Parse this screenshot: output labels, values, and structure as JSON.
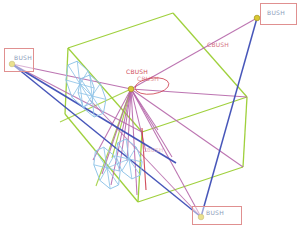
{
  "colors": {
    "background": "#ffffff",
    "frame_green": "#9acd32",
    "spring_magenta": "#b565a8",
    "link_blue": "#3d4db5",
    "wheel_blue": "#92c5e8",
    "marker_red": "#cc3a4a",
    "label_box_red": "#e09090",
    "bush_text": "#8c9cba",
    "node_yellow": "#d9c832",
    "node_outline": "#a39420"
  },
  "labels": {
    "bush_boxes": [
      {
        "text": "BUSH",
        "rect": [
          4,
          48,
          30,
          24
        ],
        "text_pos": [
          14,
          54
        ]
      },
      {
        "text": "BUSH",
        "rect": [
          260,
          3,
          37,
          22
        ],
        "text_pos": [
          267,
          9
        ]
      },
      {
        "text": "BUSH",
        "rect": [
          192,
          206,
          50,
          19
        ],
        "text_pos": [
          206,
          209
        ]
      }
    ],
    "free_labels": [
      {
        "text": "CBUSH",
        "pos": [
          207,
          42
        ],
        "color": "#d4717f",
        "opacity": 1,
        "size": 6
      },
      {
        "text": "CBUSH",
        "pos": [
          143,
          147
        ],
        "color": "#e2a3b8",
        "opacity": 0.85,
        "size": 5.5
      },
      {
        "text": "CBUSH",
        "pos": [
          126,
          69
        ],
        "color": "#cc3a4a",
        "opacity": 0.9,
        "size": 6
      },
      {
        "text": "CBUSH",
        "pos": [
          137,
          76
        ],
        "color": "#cc3a4a",
        "opacity": 0.6,
        "size": 6
      }
    ]
  },
  "geometry": {
    "hub": [
      131,
      89
    ],
    "frame_edges": [
      [
        [
          173,
          13
        ],
        [
          68,
          48
        ]
      ],
      [
        [
          173,
          13
        ],
        [
          247,
          97
        ]
      ],
      [
        [
          68,
          48
        ],
        [
          142,
          132
        ]
      ],
      [
        [
          142,
          132
        ],
        [
          247,
          97
        ]
      ],
      [
        [
          68,
          48
        ],
        [
          65,
          114
        ]
      ],
      [
        [
          142,
          132
        ],
        [
          138,
          202
        ]
      ],
      [
        [
          247,
          97
        ],
        [
          243,
          167
        ]
      ],
      [
        [
          65,
          114
        ],
        [
          138,
          202
        ]
      ],
      [
        [
          138,
          202
        ],
        [
          243,
          167
        ]
      ]
    ],
    "frame_links": [
      [
        [
          131,
          89
        ],
        [
          60,
          122
        ]
      ],
      [
        [
          131,
          89
        ],
        [
          96,
          186
        ]
      ],
      [
        [
          131,
          89
        ],
        [
          112,
          158
        ]
      ]
    ],
    "spring_targets": [
      [
        12,
        64
      ],
      [
        257,
        18
      ],
      [
        201,
        217
      ],
      [
        243,
        167
      ],
      [
        247,
        97
      ],
      [
        93,
        160
      ],
      [
        102,
        174
      ],
      [
        111,
        185
      ],
      [
        119,
        171
      ],
      [
        127,
        161
      ],
      [
        137,
        195
      ],
      [
        146,
        152
      ],
      [
        158,
        130
      ],
      [
        172,
        157
      ]
    ],
    "extra_springs": [
      [
        [
          90,
          100
        ],
        [
          201,
          217
        ]
      ],
      [
        [
          12,
          64
        ],
        [
          142,
          132
        ]
      ]
    ],
    "red_line": [
      [
        142,
        128
      ],
      [
        146,
        190
      ]
    ],
    "blue_lines": [
      [
        [
          12,
          64
        ],
        [
          201,
          217
        ]
      ],
      [
        [
          12,
          64
        ],
        [
          176,
          163
        ]
      ],
      [
        [
          257,
          18
        ],
        [
          201,
          217
        ]
      ]
    ],
    "wheels": [
      {
        "cx": 80,
        "cy": 84,
        "rx": 13,
        "ry": 24,
        "rot": -18
      },
      {
        "cx": 92,
        "cy": 96,
        "rx": 13,
        "ry": 22,
        "rot": -18
      },
      {
        "cx": 107,
        "cy": 168,
        "rx": 12,
        "ry": 22,
        "rot": -20
      },
      {
        "cx": 129,
        "cy": 159,
        "rx": 12,
        "ry": 21,
        "rot": -20
      }
    ],
    "axles": [
      [
        [
          80,
          84
        ],
        [
          92,
          96
        ]
      ],
      [
        [
          107,
          168
        ],
        [
          129,
          159
        ]
      ]
    ],
    "highlight_ellipse": {
      "cx": 152,
      "cy": 86,
      "rx": 17,
      "ry": 8,
      "rot": -8
    },
    "nodes": [
      [
        12,
        64
      ],
      [
        257,
        18
      ],
      [
        201,
        217
      ],
      [
        131,
        89
      ]
    ]
  }
}
